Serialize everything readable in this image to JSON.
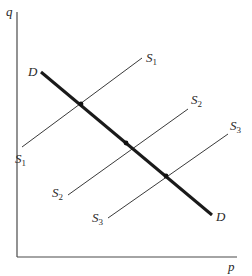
{
  "diagram": {
    "type": "supply-demand",
    "axes": {
      "y_label": "q",
      "x_label": "p"
    },
    "demand": {
      "label_start": "D",
      "label_end": "D",
      "from": [
        41,
        72
      ],
      "to": [
        212,
        215
      ]
    },
    "supply_curves": [
      {
        "name": "S1",
        "label_base": "S",
        "subscript": "1",
        "from": [
          22,
          147
        ],
        "to": [
          142,
          58
        ],
        "equilibrium": [
          81,
          104
        ]
      },
      {
        "name": "S2",
        "label_base": "S",
        "subscript": "2",
        "from": [
          68,
          195
        ],
        "to": [
          188,
          109
        ],
        "equilibrium": [
          126,
          143
        ]
      },
      {
        "name": "S3",
        "label_base": "S",
        "subscript": "3",
        "from": [
          108,
          218
        ],
        "to": [
          228,
          134
        ],
        "equilibrium": [
          166,
          176
        ]
      }
    ],
    "colors": {
      "demand": "#1a1a1a",
      "supply": "#3a3a3a",
      "axis": "#4a4a4a",
      "background": "#ffffff"
    }
  }
}
